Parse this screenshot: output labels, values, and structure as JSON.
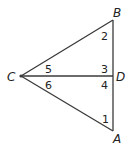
{
  "diagram": {
    "type": "geometry-figure",
    "points": {
      "A": {
        "label": "A"
      },
      "B": {
        "label": "B"
      },
      "C": {
        "label": "C"
      },
      "D": {
        "label": "D"
      }
    },
    "segments": [
      "CB",
      "CA",
      "BA",
      "CD"
    ],
    "angles": [
      {
        "number": "1",
        "vertex": "A",
        "label": "1"
      },
      {
        "number": "2",
        "vertex": "B",
        "label": "2"
      },
      {
        "number": "3",
        "vertex": "D",
        "label": "3",
        "between": "DB-DC"
      },
      {
        "number": "4",
        "vertex": "D",
        "label": "4",
        "between": "DC-DA"
      },
      {
        "number": "5",
        "vertex": "C",
        "label": "5",
        "between": "CB-CD"
      },
      {
        "number": "6",
        "vertex": "C",
        "label": "6",
        "between": "CD-CA"
      }
    ],
    "colors": {
      "line": "#3a3a3a",
      "text": "#222222",
      "background": "#ffffff"
    }
  }
}
